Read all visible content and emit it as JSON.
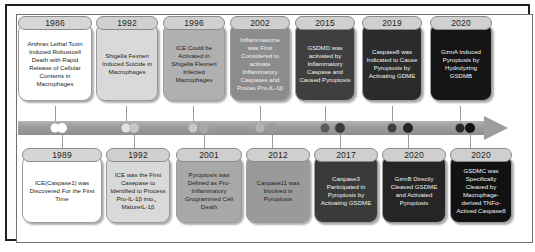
{
  "figure": {
    "axis": {
      "name": "timeline-arrow",
      "direction": "left-to-right",
      "bar_color": "#9d9d9d",
      "arrow_color": "#9d9d9d"
    }
  },
  "timeline": {
    "top_events": [
      {
        "year": "1986",
        "text": "Anthrax Lethal Toxin Induced Robustcell Death with Rapid Release of Cellular Contents in Macrophages",
        "fill": "#ffffff",
        "year_fill": "#d6d6d6",
        "text_color": "#231f20",
        "year_color": "#231f20",
        "dot_color": "#ffffff"
      },
      {
        "year": "1992",
        "text": "Shigella Fexneri Induced Suicide in Macrophages",
        "fill": "#d9d9d9",
        "year_fill": "#d0d0d0",
        "text_color": "#231f20",
        "year_color": "#231f20",
        "dot_color": "#e4e4e4"
      },
      {
        "year": "1996",
        "text": "ICE Could be Activated in Shigella Flexneri Infected Macrophages",
        "fill": "#b0b0b0",
        "year_fill": "#d0d0d0",
        "text_color": "#231f20",
        "year_color": "#231f20",
        "dot_color": "#c9c9c9"
      },
      {
        "year": "2002",
        "text": "Inflammasome was First Considered to activate Inflammatory Caspases and Proces Pro-IL-1β",
        "fill": "#8c8c8c",
        "year_fill": "#cfcfcf",
        "text_color": "#f2f2f2",
        "year_color": "#231f20",
        "dot_color": "#b3b3b3"
      },
      {
        "year": "2015",
        "text": "GSDMD was activated by Inflammatory Caspase and Caused Pyroptosis",
        "fill": "#3f3f3f",
        "year_fill": "#d0d0d0",
        "text_color": "#f2f2f2",
        "year_color": "#231f20",
        "dot_color": "#5a5a5a"
      },
      {
        "year": "2019",
        "text": "Caspase8 was Indicated to Cause Pyroptosis by Activating GDME",
        "fill": "#2b2b2b",
        "year_fill": "#d0d0d0",
        "text_color": "#f2f2f2",
        "year_color": "#231f20",
        "dot_color": "#3f3f3f"
      },
      {
        "year": "2020",
        "text": "GzmA Induced Pyroptosis by Hydrolyzing GSDMB",
        "fill": "#151515",
        "year_fill": "#d0d0d0",
        "text_color": "#f2f2f2",
        "year_color": "#231f20",
        "dot_color": "#2a2a2a"
      }
    ],
    "bottom_events": [
      {
        "year": "1989",
        "text": "ICE(Caspase1) was Discovered For the First Time",
        "fill": "#ffffff",
        "year_fill": "#d6d6d6",
        "text_color": "#231f20",
        "year_color": "#231f20",
        "dot_color": "#ffffff"
      },
      {
        "year": "1992",
        "text": "ICE was the First Casepase to Identified to Process Pro-IL-1β into、MatureIL-1β",
        "fill": "#d9d9d9",
        "year_fill": "#d0d0d0",
        "text_color": "#231f20",
        "year_color": "#231f20",
        "dot_color": "#c6c6c6"
      },
      {
        "year": "2001",
        "text": "Pyroptosis was Defined as Pro-Inflammatory Grogrammed Cell Death",
        "fill": "#a8a8a8",
        "year_fill": "#cfcfcf",
        "text_color": "#231f20",
        "year_color": "#231f20",
        "dot_color": "#a8a8a8"
      },
      {
        "year": "2012",
        "text": "Caspase11 was Involved in Pyroptosis",
        "fill": "#9a9a9a",
        "year_fill": "#cfcfcf",
        "text_color": "#231f20",
        "year_color": "#231f20",
        "dot_color": "#9a9a9a"
      },
      {
        "year": "2017",
        "text": "Canpase3 Participated in Pyroptosis by Activating GSDME",
        "fill": "#3a3a3a",
        "year_fill": "#cfcfcf",
        "text_color": "#f2f2f2",
        "year_color": "#231f20",
        "dot_color": "#3a3a3a"
      },
      {
        "year": "2020",
        "text": "GzmB Directly Cleaved GSDME and Activated Pyroptosis",
        "fill": "#252525",
        "year_fill": "#cfcfcf",
        "text_color": "#f2f2f2",
        "year_color": "#231f20",
        "dot_color": "#252525"
      },
      {
        "year": "2020",
        "text": "GSDMC was Specifically Cleaved by Macrophage-derived TNFα-Actived Caspase8",
        "fill": "#121212",
        "year_fill": "#cfcfcf",
        "text_color": "#f2f2f2",
        "year_color": "#231f20",
        "dot_color": "#121212"
      }
    ]
  }
}
